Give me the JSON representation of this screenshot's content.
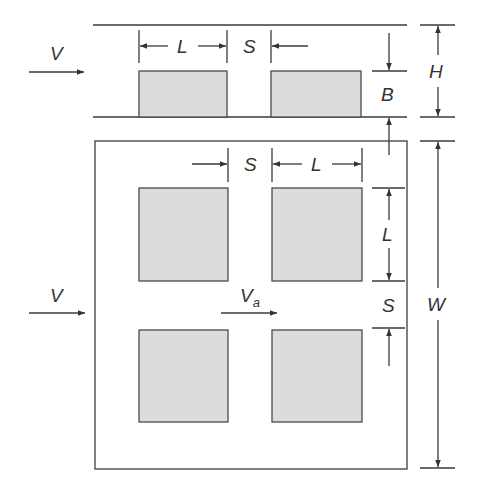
{
  "diagram": {
    "colors": {
      "line": "#3a3a3a",
      "block_fill": "#dcdcdc",
      "background": "#ffffff"
    },
    "side_view": {
      "flow_label": "V",
      "dim_block_length": "L",
      "dim_spacing": "S",
      "dim_block_height": "B",
      "dim_channel_height": "H"
    },
    "top_view": {
      "flow_label": "V",
      "approach_velocity_label": "V",
      "approach_velocity_subscript": "a",
      "dim_spacing_horizontal": "S",
      "dim_length_horizontal": "L",
      "dim_length_vertical": "L",
      "dim_spacing_vertical": "S",
      "dim_width": "W"
    }
  }
}
